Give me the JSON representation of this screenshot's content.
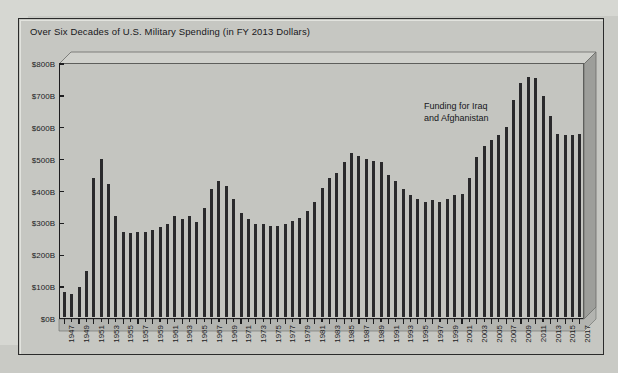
{
  "panel": {
    "title": "Over Six Decades of U.S. Military Spending (in FY 2013 Dollars)"
  },
  "annotation": {
    "line1": "Funding for Iraq",
    "line2": "and Afghanistan"
  },
  "colors": {
    "background": "#c9cac5",
    "panel": "#c6c7c2",
    "plot": "#c4c5c0",
    "bar": "#2a2a2c",
    "axis": "#1d1d1f",
    "text": "#17171a"
  },
  "chart_data": {
    "type": "bar",
    "title": "Over Six Decades of U.S. Military Spending (in FY 2013 Dollars)",
    "xlabel": "",
    "ylabel": "",
    "ylim": [
      0,
      800
    ],
    "yunit": "B",
    "ycurrency": "$",
    "ytick_labels": [
      "$0B",
      "$100B",
      "$200B",
      "$300B",
      "$400B",
      "$500B",
      "$600B",
      "$700B",
      "$800B"
    ],
    "ytick_values": [
      0,
      100,
      200,
      300,
      400,
      500,
      600,
      700,
      800
    ],
    "grid": false,
    "legend": false,
    "xtick_label_every": 2,
    "xtick_labels": [
      "1947",
      "1949",
      "1951",
      "1953",
      "1955",
      "1957",
      "1959",
      "1961",
      "1963",
      "1965",
      "1967",
      "1969",
      "1971",
      "1973",
      "1975",
      "1977",
      "1979",
      "1981",
      "1983",
      "1985",
      "1987",
      "1989",
      "1991",
      "1993",
      "1995",
      "1997",
      "1999",
      "2001",
      "2003",
      "2005",
      "2007",
      "2009",
      "2011",
      "2013",
      "2015",
      "2017"
    ],
    "categories": [
      1947,
      1948,
      1949,
      1950,
      1951,
      1952,
      1953,
      1954,
      1955,
      1956,
      1957,
      1958,
      1959,
      1960,
      1961,
      1962,
      1963,
      1964,
      1965,
      1966,
      1967,
      1968,
      1969,
      1970,
      1971,
      1972,
      1973,
      1974,
      1975,
      1976,
      1977,
      1978,
      1979,
      1980,
      1981,
      1982,
      1983,
      1984,
      1985,
      1986,
      1987,
      1988,
      1989,
      1990,
      1991,
      1992,
      1993,
      1994,
      1995,
      1996,
      1997,
      1998,
      1999,
      2000,
      2001,
      2002,
      2003,
      2004,
      2005,
      2006,
      2007,
      2008,
      2009,
      2010,
      2011,
      2012,
      2013,
      2014,
      2015,
      2016,
      2017
    ],
    "values": [
      80,
      75,
      95,
      145,
      440,
      500,
      420,
      320,
      270,
      265,
      270,
      270,
      275,
      285,
      295,
      320,
      310,
      320,
      300,
      345,
      405,
      430,
      415,
      375,
      330,
      310,
      295,
      295,
      290,
      290,
      295,
      305,
      315,
      335,
      365,
      410,
      440,
      455,
      490,
      520,
      510,
      500,
      495,
      490,
      450,
      430,
      405,
      385,
      375,
      365,
      370,
      365,
      375,
      385,
      390,
      440,
      505,
      540,
      560,
      575,
      600,
      685,
      740,
      760,
      755,
      700,
      635,
      580,
      575,
      575,
      580
    ],
    "annotations": [
      {
        "text": "Funding for Iraq and Afghanistan",
        "x": 2004,
        "y": 690
      }
    ]
  }
}
